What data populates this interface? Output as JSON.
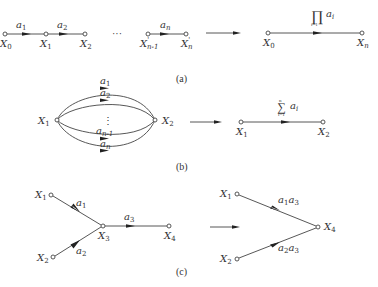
{
  "figure": {
    "panels": [
      {
        "id": "a",
        "caption": "(a)",
        "title": "Series branches",
        "before": {
          "nodes": [
            "X0",
            "X1",
            "X2",
            "X'n-1",
            "X'n"
          ],
          "node_labels": {
            "n0": "X",
            "n0_sub": "0",
            "n1": "X",
            "n1_sub": "1",
            "n2": "X",
            "n2_sub": "2",
            "n3": "X",
            "n3_sub": "n-1",
            "n3_prime": "'",
            "n4": "X",
            "n4_sub": "n",
            "n4_prime": "'"
          },
          "ellipsis": "···",
          "edges": [
            {
              "from": "X0",
              "to": "X1",
              "gain": "a",
              "gain_sub": "1"
            },
            {
              "from": "X1",
              "to": "X2",
              "gain": "a",
              "gain_sub": "2"
            },
            {
              "from": "X'n-1",
              "to": "X'n",
              "gain": "a",
              "gain_sub": "n"
            }
          ]
        },
        "after": {
          "nodes": [
            "X0",
            "Xn"
          ],
          "node_labels": {
            "n0": "X",
            "n0_sub": "0",
            "n1": "X",
            "n1_sub": "n"
          },
          "edge": {
            "from": "X0",
            "to": "Xn",
            "operator": "∏",
            "upper": "n",
            "lower": "i=1",
            "term": "a",
            "term_sub": "i"
          }
        }
      },
      {
        "id": "b",
        "caption": "(b)",
        "title": "Parallel branches",
        "before": {
          "nodes": [
            "X1",
            "X2"
          ],
          "node_labels": {
            "n0": "X",
            "n0_sub": "1",
            "n1": "X",
            "n1_sub": "2"
          },
          "vdots": "⋮",
          "edges": [
            {
              "from": "X1",
              "to": "X2",
              "gain": "a",
              "gain_sub": "1"
            },
            {
              "from": "X1",
              "to": "X2",
              "gain": "a",
              "gain_sub": "2"
            },
            {
              "from": "X1",
              "to": "X2",
              "gain": "a",
              "gain_sub": "n-1"
            },
            {
              "from": "X1",
              "to": "X2",
              "gain": "a",
              "gain_sub": "n"
            }
          ]
        },
        "after": {
          "nodes": [
            "X1",
            "X2"
          ],
          "node_labels": {
            "n0": "X",
            "n0_sub": "1",
            "n1": "X",
            "n1_sub": "2"
          },
          "edge": {
            "from": "X1",
            "to": "X2",
            "operator": "∑",
            "upper": "n",
            "lower": "i=1",
            "term": "a",
            "term_sub": "i"
          }
        }
      },
      {
        "id": "c",
        "caption": "(c)",
        "title": "Eliminating an intermediate node",
        "before": {
          "nodes": [
            "X1",
            "X2",
            "X3",
            "X4"
          ],
          "node_labels": {
            "n0": "X",
            "n0_sub": "1",
            "n1": "X",
            "n1_sub": "2",
            "n2": "X",
            "n2_sub": "3",
            "n3": "X",
            "n3_sub": "4"
          },
          "edges": [
            {
              "from": "X1",
              "to": "X3",
              "gain": "a",
              "gain_sub": "1"
            },
            {
              "from": "X2",
              "to": "X3",
              "gain": "a",
              "gain_sub": "2"
            },
            {
              "from": "X3",
              "to": "X4",
              "gain": "a",
              "gain_sub": "3"
            }
          ]
        },
        "after": {
          "nodes": [
            "X1",
            "X2",
            "X4"
          ],
          "node_labels": {
            "n0": "X",
            "n0_sub": "1",
            "n1": "X",
            "n1_sub": "2",
            "n2": "X",
            "n2_sub": "4"
          },
          "edges": [
            {
              "from": "X1",
              "to": "X4",
              "gain_a": "a",
              "sub_a": "1",
              "gain_b": "a",
              "sub_b": "3"
            },
            {
              "from": "X2",
              "to": "X4",
              "gain_a": "a",
              "sub_a": "2",
              "gain_b": "a",
              "sub_b": "3"
            }
          ]
        }
      }
    ],
    "colors": {
      "line": "#444444",
      "text": "#333333",
      "arrowhead": "#222222",
      "background": "#ffffff"
    }
  }
}
